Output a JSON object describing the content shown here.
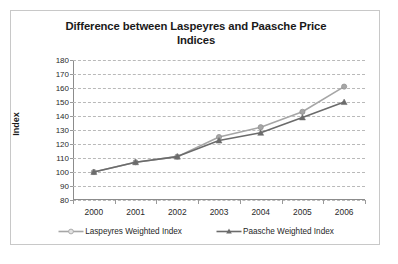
{
  "chart_data": {
    "type": "line",
    "title": "Difference between Laspeyres and Paasche Price Indices",
    "title_line1": "Difference between Laspeyres and Paasche Price",
    "title_line2": "Indices",
    "xlabel": "",
    "ylabel": "Index",
    "categories": [
      "2000",
      "2001",
      "2002",
      "2003",
      "2004",
      "2005",
      "2006"
    ],
    "x": [
      2000,
      2001,
      2002,
      2003,
      2004,
      2005,
      2006
    ],
    "ylim": [
      80,
      180
    ],
    "yticks": [
      80,
      90,
      100,
      110,
      120,
      130,
      140,
      150,
      160,
      170,
      180
    ],
    "ytick_labels": [
      "80",
      "90",
      "100",
      "110",
      "120",
      "130",
      "140",
      "150",
      "160",
      "170",
      "180"
    ],
    "grid": true,
    "grid_style": "dashed-horizontal",
    "legend_position": "bottom",
    "series": [
      {
        "name": "Laspeyres Weighted Index",
        "values": [
          100,
          107,
          111,
          125,
          132,
          143,
          161
        ],
        "color": "#a6a6a6",
        "marker": "circle"
      },
      {
        "name": "Paasche Weighted Index",
        "values": [
          100,
          107,
          111,
          122.5,
          128,
          139,
          150
        ],
        "color": "#6b6b6b",
        "marker": "triangle"
      }
    ]
  },
  "legend": {
    "items": [
      {
        "label": "Laspeyres Weighted Index",
        "color": "#a6a6a6",
        "marker": "circle"
      },
      {
        "label": "Paasche Weighted Index",
        "color": "#6b6b6b",
        "marker": "triangle"
      }
    ]
  },
  "colors": {
    "frame_border": "#c8c8c8",
    "gridline": "#b9b9b9",
    "axis": "#8c8c8c",
    "text": "#1a1a1a",
    "background": "#ffffff"
  }
}
